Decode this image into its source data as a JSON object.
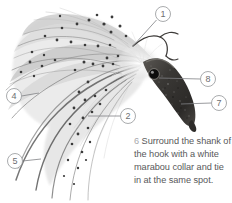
{
  "figure": {
    "name": "fly-tying-step-illustration",
    "background_color": "#ffffff"
  },
  "callouts": [
    {
      "id": "callout-1",
      "label": "1",
      "cx": 163,
      "cy": 14,
      "r": 7.5,
      "leader": "M 156.5,20 L 133,46"
    },
    {
      "id": "callout-2",
      "label": "2",
      "cx": 128,
      "cy": 116,
      "r": 7.5,
      "leader": "M 120.5,116 L 88,116"
    },
    {
      "id": "callout-4",
      "label": "4",
      "cx": 14,
      "cy": 96,
      "r": 7.5,
      "leader": "M 21.5,96 L 39,93"
    },
    {
      "id": "callout-5",
      "label": "5",
      "cx": 15,
      "cy": 161,
      "r": 7.5,
      "leader": "M 22.5,161 L 41,159"
    },
    {
      "id": "callout-7",
      "label": "7",
      "cx": 219,
      "cy": 103,
      "r": 7.5,
      "leader": "M 211.5,103 L 181,104"
    },
    {
      "id": "callout-8",
      "label": "8",
      "cx": 208,
      "cy": 79,
      "r": 7.5,
      "leader": "M 200.5,79 L 159,78"
    }
  ],
  "caption": {
    "step_number": "6",
    "text": "Surround the shank of the hook with a white marabou collar and tie in at the same spot.",
    "color": "#58585a"
  },
  "colors": {
    "feather_light": "#dcdcdc",
    "feather_mid": "#b4b4b4",
    "feather_dark": "#6b6b6b",
    "body_dark": "#3c3a38",
    "eye_black": "#111111",
    "leader_gray": "#808285",
    "circle_stroke": "#939598",
    "caption_gray": "#58585a",
    "step_number_gray": "#a7a9ac"
  }
}
